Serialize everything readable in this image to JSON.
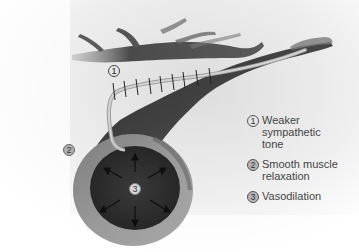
{
  "diagram": {
    "callouts": [
      {
        "number": "1",
        "target": "sympathetic-nerve-fiber"
      },
      {
        "number": "2",
        "target": "smooth-muscle-wall"
      },
      {
        "number": "3",
        "target": "vessel-lumen"
      }
    ],
    "legend": [
      {
        "number": "1",
        "label": "Weaker sympathetic tone"
      },
      {
        "number": "2",
        "label": "Smooth muscle relaxation"
      },
      {
        "number": "3",
        "label": "Vasodilation"
      }
    ],
    "colors": {
      "background": "#ffffff",
      "vessel_dark": "#3a3a3a",
      "vessel_wall": "#8e8e8e",
      "lumen": "#2b2b2b",
      "nerve": "#bdbdbd",
      "text": "#444444"
    }
  }
}
